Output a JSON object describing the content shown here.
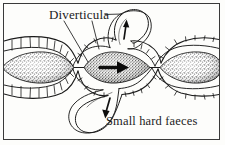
{
  "figure": {
    "width": 225,
    "height": 145,
    "background_color": "#fdfdfb",
    "ink_color": "#1b1b1b",
    "frame_color": "#3a3a3a"
  },
  "labels": {
    "diverticula": "Diverticula",
    "faeces": "Small hard faeces"
  },
  "annotations": {
    "leader_lines": 2,
    "flow_arrow_direction": "right",
    "diverticulum_upper_arrow_direction": "up",
    "diverticulum_lower_arrow_direction": "down"
  },
  "anatomy": {
    "bowel_segments": 3,
    "diverticula_count": 2,
    "wall_texture": "segmented haustra with radial dividers",
    "lumen_content": "stippled hard faecal mass"
  }
}
